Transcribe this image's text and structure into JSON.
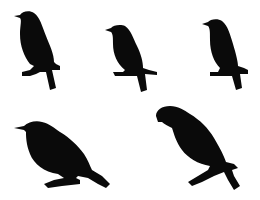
{
  "image": {
    "background": "#ffffff",
    "silhouette_color": "#0a0a0a",
    "subject": "bird silhouettes perched on branches",
    "birds": [
      {
        "id": 1,
        "pose": "perched, upright, facing left"
      },
      {
        "id": 2,
        "pose": "perched, upright, facing left"
      },
      {
        "id": 3,
        "pose": "perched, upright, facing left"
      },
      {
        "id": 4,
        "pose": "perched, leaning forward, facing left"
      },
      {
        "id": 5,
        "pose": "perched, hunched, facing left"
      }
    ]
  }
}
